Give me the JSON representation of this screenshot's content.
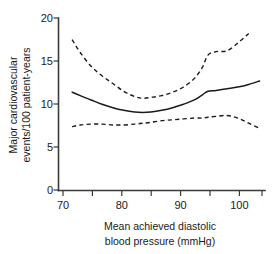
{
  "chart_data": {
    "type": "line",
    "title": "",
    "subtitle": "",
    "xlabel_line1": "Mean achieved diastolic",
    "xlabel_line2": "blood pressure (mmHg)",
    "ylabel_line1": "Major cardiovascular",
    "ylabel_line2": "events/100 patient-years",
    "xlim": [
      68,
      106
    ],
    "ylim": [
      0,
      20
    ],
    "xticks": [
      70,
      75,
      80,
      85,
      90,
      95,
      100,
      105
    ],
    "xtick_labels": [
      "70",
      "",
      "80",
      "",
      "90",
      "",
      "100",
      ""
    ],
    "yticks": [
      0,
      5,
      10,
      15,
      20
    ],
    "ytick_labels": [
      "0",
      "5",
      "10",
      "15",
      "20"
    ],
    "grid": false,
    "legend": "none",
    "x": [
      70.5,
      72,
      74,
      76,
      78,
      80,
      82,
      83.5,
      85,
      87,
      89,
      91,
      93,
      94.5,
      95.5,
      97,
      99,
      101,
      103,
      105
    ],
    "series": [
      {
        "name": "Fitted risk (solid)",
        "style": "solid",
        "values": [
          11.4,
          11.0,
          10.5,
          10.0,
          9.6,
          9.3,
          9.1,
          9.05,
          9.1,
          9.3,
          9.6,
          10.0,
          10.5,
          11.1,
          11.5,
          11.6,
          11.8,
          12.0,
          12.3,
          12.7
        ]
      },
      {
        "name": "Upper 95% confidence limit (dashed)",
        "style": "dashed",
        "x_end": 102,
        "values": [
          17.5,
          16.0,
          14.4,
          13.3,
          12.4,
          11.5,
          10.9,
          10.7,
          10.8,
          11.0,
          11.4,
          12.0,
          13.0,
          14.3,
          15.7,
          16.1,
          16.2,
          17.1,
          18.2,
          null
        ]
      },
      {
        "name": "Lower 95% confidence limit (dashed)",
        "style": "dashed",
        "values": [
          7.4,
          7.6,
          7.7,
          7.7,
          7.6,
          7.6,
          7.7,
          7.8,
          7.9,
          8.1,
          8.2,
          8.3,
          8.4,
          8.4,
          8.5,
          8.6,
          8.7,
          8.4,
          7.8,
          7.2
        ]
      }
    ],
    "annotations": []
  }
}
